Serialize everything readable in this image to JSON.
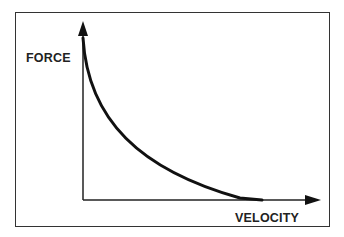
{
  "diagram": {
    "type": "force-velocity curve",
    "y_axis_label": "FORCE",
    "x_axis_label": "VELOCITY",
    "curve": "hyperbolic decreasing (force falls as velocity rises)",
    "colors": {
      "line": "#111111",
      "frame": "#333333",
      "background": "#ffffff"
    }
  }
}
